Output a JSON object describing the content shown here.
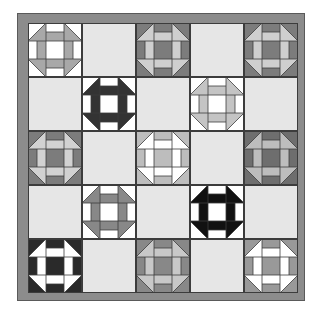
{
  "quilt": {
    "border_color": "#8c8c8c",
    "plain_color": "#e6e6e6",
    "line_color": "#3c3c3c",
    "rows": 5,
    "cols": 5,
    "blocks": [
      {
        "row": 0,
        "col": 0,
        "type": "churn-dash",
        "bg": "#ffffff",
        "dash": "#a8a8a8"
      },
      {
        "row": 0,
        "col": 1,
        "type": "plain"
      },
      {
        "row": 0,
        "col": 2,
        "type": "churn-dash",
        "bg": "#7c7c7c",
        "dash": "#cfcfcf"
      },
      {
        "row": 0,
        "col": 3,
        "type": "plain"
      },
      {
        "row": 0,
        "col": 4,
        "type": "churn-dash",
        "bg": "#7c7c7c",
        "dash": "#cfcfcf"
      },
      {
        "row": 1,
        "col": 0,
        "type": "plain"
      },
      {
        "row": 1,
        "col": 1,
        "type": "churn-dash",
        "bg": "#ffffff",
        "dash": "#333333"
      },
      {
        "row": 1,
        "col": 2,
        "type": "plain"
      },
      {
        "row": 1,
        "col": 3,
        "type": "churn-dash",
        "bg": "#ffffff",
        "dash": "#c4c4c4"
      },
      {
        "row": 1,
        "col": 4,
        "type": "plain"
      },
      {
        "row": 2,
        "col": 0,
        "type": "churn-dash",
        "bg": "#7c7c7c",
        "dash": "#d2d2d2"
      },
      {
        "row": 2,
        "col": 1,
        "type": "plain"
      },
      {
        "row": 2,
        "col": 2,
        "type": "churn-dash",
        "bg": "#bdbdbd",
        "dash": "#ffffff"
      },
      {
        "row": 2,
        "col": 3,
        "type": "plain"
      },
      {
        "row": 2,
        "col": 4,
        "type": "churn-dash",
        "bg": "#6e6e6e",
        "dash": "#bdbdbd"
      },
      {
        "row": 3,
        "col": 0,
        "type": "plain"
      },
      {
        "row": 3,
        "col": 1,
        "type": "churn-dash",
        "bg": "#ffffff",
        "dash": "#888888"
      },
      {
        "row": 3,
        "col": 2,
        "type": "plain"
      },
      {
        "row": 3,
        "col": 3,
        "type": "churn-dash",
        "bg": "#ffffff",
        "dash": "#111111"
      },
      {
        "row": 3,
        "col": 4,
        "type": "plain"
      },
      {
        "row": 4,
        "col": 0,
        "type": "churn-dash",
        "bg": "#2a2a2a",
        "dash": "#ffffff"
      },
      {
        "row": 4,
        "col": 1,
        "type": "plain"
      },
      {
        "row": 4,
        "col": 2,
        "type": "churn-dash",
        "bg": "#888888",
        "dash": "#c8c8c8"
      },
      {
        "row": 4,
        "col": 3,
        "type": "plain"
      },
      {
        "row": 4,
        "col": 4,
        "type": "churn-dash",
        "bg": "#999999",
        "dash": "#ffffff"
      }
    ]
  }
}
